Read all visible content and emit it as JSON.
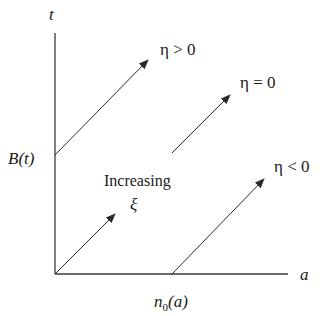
{
  "axes": {
    "y_label": "t",
    "x_label": "a",
    "y_intercept_label": "B(t)",
    "x_intercept_label_base": "n",
    "x_intercept_label_sub": "0",
    "x_intercept_label_arg": "(a)"
  },
  "arrows": [
    {
      "id": "eta-positive",
      "label": "η > 0",
      "x1": 55,
      "y1": 155,
      "x2": 148,
      "y2": 60,
      "lx": 158,
      "ly": 52
    },
    {
      "id": "eta-zero",
      "label": "η = 0",
      "x1": 172,
      "y1": 153,
      "x2": 230,
      "y2": 95,
      "lx": 240,
      "ly": 86
    },
    {
      "id": "eta-negative",
      "label": "η < 0",
      "x1": 172,
      "y1": 274,
      "x2": 264,
      "y2": 179,
      "lx": 274,
      "ly": 170
    },
    {
      "id": "increasing-xi",
      "label": "",
      "x1": 55,
      "y1": 274,
      "x2": 115,
      "y2": 214,
      "lx": 0,
      "ly": 0
    }
  ],
  "annotation": {
    "line1": "Increasing",
    "line2": "ξ"
  },
  "colors": {
    "stroke": "#2a2a2a",
    "text": "#1a1a1a",
    "background": "#ffffff"
  }
}
